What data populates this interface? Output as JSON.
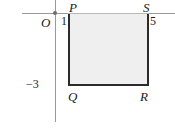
{
  "figure": {
    "colors": {
      "axis": "#9a9a9a",
      "rectangle_outline": "#2b2b2b",
      "rectangle_fill": "#efefef",
      "text": "#1c1c1c"
    }
  },
  "chart_data": {
    "type": "scatter",
    "title": "",
    "xlabel": "",
    "ylabel": "",
    "grid": false,
    "legend": null,
    "origin_label": "O",
    "x_tick_labels": [
      "1",
      "5"
    ],
    "y_tick_labels": [
      "-3"
    ],
    "xlim": [
      -2,
      7
    ],
    "ylim": [
      -4.5,
      1
    ],
    "shapes": [
      {
        "name": "rectangle-PQRS",
        "kind": "rectangle",
        "filled": true,
        "vertices": [
          {
            "label": "P",
            "x": 1,
            "y": 0
          },
          {
            "label": "S",
            "x": 5,
            "y": 0
          },
          {
            "label": "R",
            "x": 5,
            "y": -3
          },
          {
            "label": "Q",
            "x": 1,
            "y": -3
          }
        ]
      }
    ]
  },
  "labels": {
    "vertex_P": "P",
    "vertex_Q": "Q",
    "vertex_R": "R",
    "vertex_S": "S",
    "origin": "O",
    "tick_x_1": "1",
    "tick_x_5": "5",
    "tick_y_neg3": "−3"
  }
}
